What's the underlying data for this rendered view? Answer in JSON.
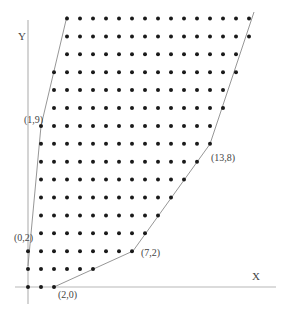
{
  "diagram": {
    "type": "lattice-point-region",
    "axes": {
      "x_label": "X",
      "y_label": "Y"
    },
    "vertex_labels": [
      {
        "text": "(0,2)",
        "x": 14,
        "y": 241
      },
      {
        "text": "(1,9)",
        "x": 24,
        "y": 123
      },
      {
        "text": "(2,0)",
        "x": 58,
        "y": 298
      },
      {
        "text": "(7,2)",
        "x": 141,
        "y": 256
      },
      {
        "text": "(13,8)",
        "x": 211,
        "y": 161
      }
    ],
    "grid": {
      "origin_x": 28,
      "origin_y": 287,
      "dx": 13,
      "dy": 17.9
    },
    "rows": [
      {
        "row": 0,
        "from": 0,
        "to": 2
      },
      {
        "row": 1,
        "from": 0,
        "to": 5
      },
      {
        "row": 2,
        "from": 0,
        "to": 8
      },
      {
        "row": 3,
        "from": 1,
        "to": 9
      },
      {
        "row": 4,
        "from": 1,
        "to": 10
      },
      {
        "row": 5,
        "from": 1,
        "to": 11
      },
      {
        "row": 6,
        "from": 1,
        "to": 12
      },
      {
        "row": 7,
        "from": 1,
        "to": 13
      },
      {
        "row": 8,
        "from": 1,
        "to": 14
      },
      {
        "row": 9,
        "from": 1,
        "to": 14
      },
      {
        "row": 10,
        "from": 2,
        "to": 15
      },
      {
        "row": 11,
        "from": 2,
        "to": 15
      },
      {
        "row": 12,
        "from": 2,
        "to": 16
      },
      {
        "row": 13,
        "from": 3,
        "to": 16
      },
      {
        "row": 14,
        "from": 3,
        "to": 17
      },
      {
        "row": 15,
        "from": 3,
        "to": 17
      }
    ],
    "boundary_lines": [
      {
        "name": "left-boundary",
        "points": [
          [
            28,
            266
          ],
          [
            41,
            126
          ],
          [
            67,
            16
          ]
        ]
      },
      {
        "name": "bottom-boundary",
        "points": [
          [
            54,
            287
          ],
          [
            133,
            251
          ]
        ]
      },
      {
        "name": "right-boundary",
        "points": [
          [
            133,
            251
          ],
          [
            210,
            144
          ],
          [
            254,
            12
          ]
        ]
      }
    ]
  }
}
